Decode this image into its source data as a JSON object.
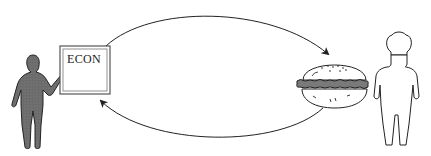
{
  "diagram": {
    "board": {
      "label": "ECON"
    },
    "nodes": [
      {
        "id": "teacher",
        "description": "economics teacher pointing at board"
      },
      {
        "id": "hamburger",
        "description": "hamburger"
      },
      {
        "id": "chef",
        "description": "chef"
      }
    ],
    "edges": [
      {
        "from": "board",
        "to": "hamburger",
        "position": "upper arc"
      },
      {
        "from": "hamburger",
        "to": "board",
        "position": "lower arc"
      }
    ]
  },
  "colors": {
    "stroke": "#222222",
    "figure_fill": "#6b6b6b",
    "patty": "#7a7a7a",
    "background": "#ffffff"
  }
}
